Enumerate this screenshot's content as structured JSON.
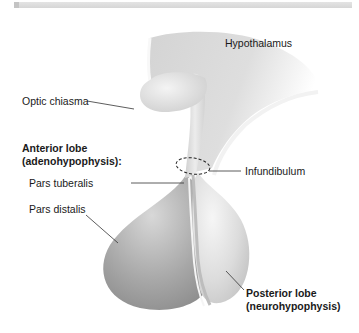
{
  "diagram": {
    "labels": {
      "hypothalamus": "Hypothalamus",
      "optic_chiasma": "Optic chiasma",
      "anterior_lobe_heading_line1": "Anterior lobe",
      "anterior_lobe_heading_line2": "(adenohypophysis):",
      "pars_tuberalis": "Pars tuberalis",
      "pars_distalis": "Pars distalis",
      "infundibulum": "Infundibulum",
      "posterior_lobe_line1": "Posterior lobe",
      "posterior_lobe_line2": "(neurohypophysis)"
    },
    "colors": {
      "background": "#ffffff",
      "tissue_light": "#eeeeee",
      "tissue_mid": "#c8c8c8",
      "tissue_dark": "#9a9a9a",
      "leader_line": "#333333",
      "text": "#1a1a1a"
    }
  }
}
